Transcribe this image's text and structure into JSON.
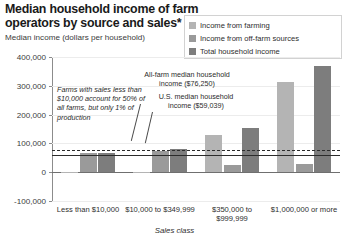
{
  "header": {
    "title": "Median household income of farm operators by source and sales* class, 2016",
    "subtitle": "Median income (dollars per household)"
  },
  "legend": {
    "items": [
      {
        "label": "Income from farming",
        "color": "#b4b4b4",
        "icon": "legend-swatch-farming"
      },
      {
        "label": "Income from off-farm sources",
        "color": "#9a9a9a",
        "icon": "legend-swatch-offfarm"
      },
      {
        "label": "Total household income",
        "color": "#7d7d7d",
        "icon": "legend-swatch-total"
      }
    ]
  },
  "annotations": {
    "small_farms": "Farms with sales less than $10,000 account for 50% of all farms, but only 1% of production",
    "all_farm_median": "All-farm median household income ($76,250)",
    "us_median": "U.S. median household income ($59,039)"
  },
  "chart_data": {
    "type": "bar",
    "title": "Median household income of farm operators by source and sales* class, 2016",
    "subtitle": "Median income (dollars per household)",
    "xlabel": "Sales class",
    "ylabel": "Median income (dollars per household)",
    "ylim": [
      -100000,
      400000
    ],
    "ytick_values": [
      -100000,
      0,
      100000,
      200000,
      300000,
      400000
    ],
    "ytick_labels": [
      "-100,000",
      "0",
      "100,000",
      "200,000",
      "300,000",
      "400,000"
    ],
    "grid": true,
    "legend_position": "top-right",
    "categories": [
      "Less than $10,000",
      "$10,000 to $349,999",
      "$350,000 to $999,999",
      "$1,000,000 or more"
    ],
    "series": [
      {
        "name": "Income from farming",
        "color": "#b4b4b4",
        "values": [
          -1200,
          -3500,
          130000,
          312000
        ]
      },
      {
        "name": "Income from off-farm sources",
        "color": "#9a9a9a",
        "values": [
          66000,
          72000,
          25000,
          28000
        ]
      },
      {
        "name": "Total household income",
        "color": "#7d7d7d",
        "values": [
          68000,
          80000,
          155000,
          368000
        ]
      }
    ],
    "reference_lines": [
      {
        "name": "All-farm median household income",
        "value": 76250,
        "style": "dashed",
        "label": "$76,250"
      },
      {
        "name": "U.S. median household income",
        "value": 59039,
        "style": "solid",
        "label": "$59,039"
      }
    ]
  }
}
